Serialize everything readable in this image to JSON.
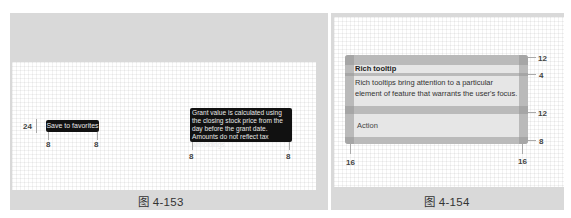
{
  "figure_left": {
    "caption": "图 4-153",
    "plain_tooltip": {
      "label": "Save to favorites",
      "height_spec": "24",
      "padding_left": "8",
      "padding_right": "8"
    },
    "multiline_tooltip": {
      "text": "Grant value is calculated using the closing stock price from the day before the grant date. Amounts do not reflect tax witholdings.",
      "padding_left": "8",
      "padding_right": "8"
    }
  },
  "figure_right": {
    "caption": "图 4-154",
    "rich_tooltip": {
      "title": "Rich tooltip",
      "body": "Rich tooltips bring attention to a particular element of feature that warrants the user's focus.",
      "action": "Action",
      "spacing_top": "12",
      "spacing_title_body": "4",
      "spacing_body_action": "12",
      "spacing_bottom": "8",
      "padding_left": "16",
      "padding_right": "16"
    }
  },
  "colors": {
    "figure_bg": "#d9d9d9",
    "dark_tooltip": "#111111",
    "rich_tooltip": "#e6e6e6"
  }
}
